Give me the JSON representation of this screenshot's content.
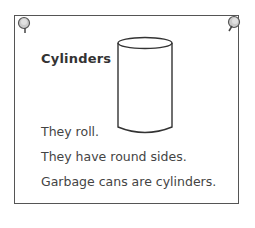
{
  "card": {
    "title": "Cylinders",
    "lines": [
      "They roll.",
      "They have round sides.",
      "Garbage cans are cylinders."
    ]
  },
  "colors": {
    "border": "#555555",
    "text": "#444444",
    "pin": "#bbbbbb"
  }
}
